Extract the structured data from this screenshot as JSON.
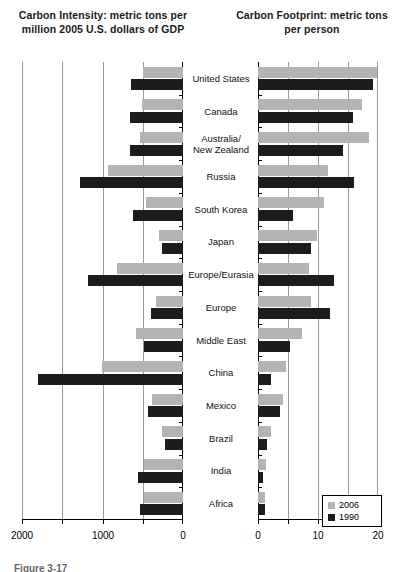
{
  "figure": {
    "caption": "Figure 3-17",
    "left_title": "Carbon Intensity:\nmetric tons per million\n2005 U.S. dollars of GDP",
    "right_title": "Carbon Footprint:\nmetric tons per person"
  },
  "legend": {
    "position": "bottom-right",
    "entries": [
      {
        "label": "2006",
        "color": "#b4b4b4"
      },
      {
        "label": "1990",
        "color": "#1c1c1c"
      }
    ]
  },
  "chart_data": [
    {
      "id": "carbon-intensity",
      "type": "bar",
      "orientation": "horizontal-left",
      "title": "Carbon Intensity: metric tons per million 2005 U.S. dollars of GDP",
      "xlabel": "metric tons per million 2005 U.S. dollars of GDP",
      "ylabel": "",
      "xlim": [
        2000,
        0
      ],
      "reversed_axis": true,
      "grid": true,
      "ticks": [
        2000,
        1500,
        1000,
        500,
        0
      ],
      "tick_labels": [
        "2000",
        "",
        "1000",
        "",
        "0"
      ],
      "categories": [
        "United States",
        "Canada",
        "Australia/\nNew Zealand",
        "Russia",
        "South Korea",
        "Japan",
        "Europe/Eurasia",
        "Europe",
        "Middle East",
        "China",
        "Mexico",
        "Brazil",
        "India",
        "Africa"
      ],
      "series": [
        {
          "name": "2006",
          "color": "#b4b4b4",
          "values": [
            500,
            510,
            530,
            930,
            460,
            300,
            820,
            340,
            590,
            1000,
            380,
            260,
            480,
            480
          ]
        },
        {
          "name": "1990",
          "color": "#1c1c1c",
          "values": [
            640,
            660,
            660,
            1280,
            620,
            260,
            1180,
            400,
            490,
            1800,
            440,
            220,
            560,
            540
          ]
        }
      ]
    },
    {
      "id": "carbon-footprint",
      "type": "bar",
      "orientation": "horizontal-right",
      "title": "Carbon Footprint: metric tons per person",
      "xlabel": "metric tons per person",
      "ylabel": "",
      "xlim": [
        0,
        20
      ],
      "grid": true,
      "ticks": [
        0,
        5,
        10,
        15,
        20
      ],
      "tick_labels": [
        "0",
        "",
        "10",
        "",
        "20"
      ],
      "categories": [
        "United States",
        "Canada",
        "Australia/\nNew Zealand",
        "Russia",
        "South Korea",
        "Japan",
        "Europe/Eurasia",
        "Europe",
        "Middle East",
        "China",
        "Mexico",
        "Brazil",
        "India",
        "Africa"
      ],
      "series": [
        {
          "name": "2006",
          "color": "#b4b4b4",
          "values": [
            19.8,
            17.3,
            18.5,
            11.6,
            11.0,
            9.8,
            8.5,
            8.8,
            7.4,
            4.7,
            4.2,
            2.2,
            1.3,
            1.2
          ]
        },
        {
          "name": "1990",
          "color": "#1c1c1c",
          "values": [
            19.2,
            15.9,
            14.2,
            16.0,
            5.8,
            8.8,
            12.6,
            12.0,
            5.3,
            2.2,
            3.6,
            1.5,
            0.8,
            1.1
          ]
        }
      ]
    }
  ]
}
